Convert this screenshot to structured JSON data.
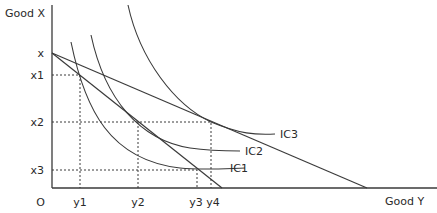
{
  "axes": {
    "y_axis_label": "Good X",
    "x_axis_label": "Good Y",
    "origin_label": "O"
  },
  "x_ticks": [
    "x",
    "x1",
    "x2",
    "x3"
  ],
  "y_ticks": [
    "y1",
    "y2",
    "y3",
    "y4"
  ],
  "curves": {
    "ic1": "IC1",
    "ic2": "IC2",
    "ic3": "IC3"
  },
  "budget_lines": [
    {
      "name": "inner",
      "from": "x",
      "to_y_intercept": "near y4"
    },
    {
      "name": "outer",
      "from": "x",
      "to_y_intercept": "far right"
    }
  ],
  "colors": {
    "ink": "#3a3a3a",
    "background": "#ffffff"
  }
}
